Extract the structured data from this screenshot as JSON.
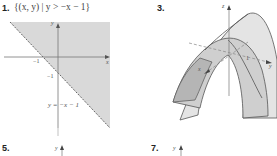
{
  "exercises": [
    {
      "number": "1.",
      "caption": "{(x, y) | y > −x − 1}",
      "graph": {
        "type": "region-plot",
        "axis_x_label": "x",
        "axis_y_label": "y",
        "x_intercept_label": "−1",
        "y_intercept_label": "−1",
        "line_label": "y = −x − 1",
        "shade_color": "#d9d9d9"
      }
    },
    {
      "number": "3.",
      "graph": {
        "type": "3d-surface",
        "axis_x_label": "x",
        "axis_y_label": "y",
        "axis_z_label": "z",
        "tick_label": "1",
        "surface_color": "#d6d6d6"
      }
    },
    {
      "number": "5.",
      "graph": {
        "axis_y_label": "y"
      }
    },
    {
      "number": "7.",
      "graph": {
        "axis_y_label": "y"
      }
    }
  ]
}
